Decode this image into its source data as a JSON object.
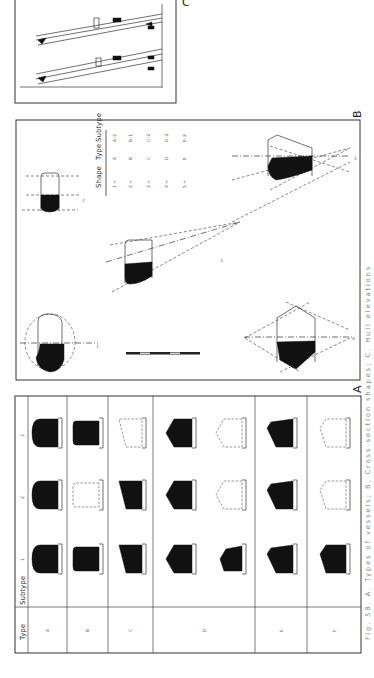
{
  "figure": {
    "caption": "Fig. 58. A. Types of vessels; B. Cross-section shapes; C. Hull elevations",
    "panel_labels": {
      "A": "A",
      "B": "B",
      "C": "C"
    }
  },
  "panel_a": {
    "header": {
      "type": "Type",
      "subtype": "Subtype"
    },
    "subtype_labels": [
      "1",
      "2",
      "3"
    ],
    "types": [
      {
        "label": "A",
        "cells": [
          {
            "sub": "1",
            "style": "filled",
            "shape": "round"
          },
          {
            "sub": "2",
            "style": "filled",
            "shape": "round-notch"
          },
          {
            "sub": "3",
            "style": "filled",
            "shape": "round-notch"
          }
        ]
      },
      {
        "label": "B",
        "cells": [
          {
            "sub": "1",
            "style": "filled",
            "shape": "box"
          },
          {
            "sub": "2",
            "style": "dashed",
            "shape": "box-notch"
          },
          {
            "sub": "3",
            "style": "filled",
            "shape": "box-notch"
          }
        ]
      },
      {
        "label": "C",
        "cells": [
          {
            "sub": "1",
            "style": "filled",
            "shape": "slope"
          },
          {
            "sub": "2",
            "style": "filled",
            "shape": "slope-notch"
          },
          {
            "sub": "3",
            "style": "dashed",
            "shape": "slope-notch"
          }
        ]
      },
      {
        "label": "D",
        "cells": [
          {
            "sub": "1",
            "style": "filled",
            "shape": "peak"
          },
          {
            "sub": "2",
            "style": "filled",
            "shape": "peak-notch"
          },
          {
            "sub": "3",
            "style": "filled",
            "shape": "peak-notch"
          }
        ]
      },
      {
        "label": "D",
        "cells": [
          {
            "sub": "1",
            "style": "filled",
            "shape": "peak-low"
          },
          {
            "sub": "2",
            "style": "dashed",
            "shape": "peak-notch"
          },
          {
            "sub": "3",
            "style": "dashed",
            "shape": "peak-notch"
          }
        ]
      },
      {
        "label": "E",
        "cells": [
          {
            "sub": "1",
            "style": "filled",
            "shape": "peak-slope"
          },
          {
            "sub": "2",
            "style": "filled",
            "shape": "peak-slope-notch"
          },
          {
            "sub": "3",
            "style": "filled",
            "shape": "peak-slope-notch"
          }
        ]
      },
      {
        "label": "F",
        "cells": [
          {
            "sub": "1",
            "style": "filled",
            "shape": "rise"
          },
          {
            "sub": "2",
            "style": "dashed",
            "shape": "rise-notch"
          },
          {
            "sub": "3",
            "style": "dashed",
            "shape": "rise-notch"
          }
        ]
      }
    ],
    "type_row_labels": [
      "A",
      "B",
      "C",
      "D",
      "E",
      "F"
    ]
  },
  "panel_b": {
    "table": {
      "headers": [
        "Shape",
        "Type",
        "Subtype"
      ],
      "rows": [
        [
          "1 =",
          "A",
          "A–2"
        ],
        [
          "2 =",
          "B",
          "B–1"
        ],
        [
          "3 =",
          "C",
          "C–2"
        ],
        [
          "4 =",
          "D",
          "D–2"
        ],
        [
          "5 =",
          "E",
          "E–2"
        ]
      ]
    },
    "diagram_labels": [
      "1",
      "2",
      "3",
      "4",
      "5"
    ]
  },
  "panel_c": {
    "description": "Two hull elevation drawings"
  }
}
